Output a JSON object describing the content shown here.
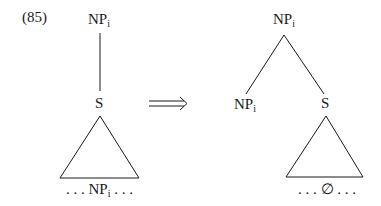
{
  "example_number": "(85)",
  "left_tree": {
    "root": {
      "label": "NP",
      "subscript": "i"
    },
    "child": {
      "label": "S"
    },
    "terminal": {
      "prefix": ". . . ",
      "label": "NP",
      "subscript": "i",
      "suffix": " . . ."
    }
  },
  "arrow": {
    "symbol": "double-right-arrow"
  },
  "right_tree": {
    "root": {
      "label": "NP",
      "subscript": "i"
    },
    "left_child": {
      "label": "NP",
      "subscript": "i"
    },
    "right_child": {
      "label": "S"
    },
    "terminal": {
      "text": ". . . ∅ . . ."
    }
  },
  "colors": {
    "ink": "#1a1a1a",
    "background": "#ffffff"
  }
}
